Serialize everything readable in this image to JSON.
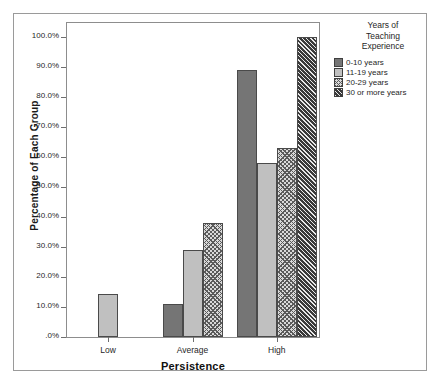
{
  "chart_data": {
    "type": "bar",
    "title": "",
    "xlabel": "Persistence",
    "ylabel": "Percentage of Each Group",
    "categories": [
      "Low",
      "Average",
      "High"
    ],
    "ylim": [
      0,
      100
    ],
    "ytick_labels": [
      "100.0%",
      "90.0%",
      "80.0%",
      "70.0%",
      "60.0%",
      "50.0%",
      "40.0%",
      "30.0%",
      "20.0%",
      "10.0%",
      ".0%"
    ],
    "ytick_values": [
      100,
      90,
      80,
      70,
      60,
      50,
      40,
      30,
      20,
      10,
      0
    ],
    "grid": false,
    "legend_position": "right",
    "legend_title": "Years of\nTeaching\nExperience",
    "series": [
      {
        "name": "0-10 years",
        "fill": "solid-dark",
        "color": "#757575",
        "values": [
          0,
          11,
          89
        ]
      },
      {
        "name": "11-19 years",
        "fill": "solid-light",
        "color": "#c0c0c0",
        "values": [
          14.3,
          29,
          58
        ]
      },
      {
        "name": "20-29 years",
        "fill": "hatch-light",
        "color": "#d9d9d9",
        "values": [
          0,
          38,
          63
        ]
      },
      {
        "name": "30 or more years",
        "fill": "hatch-dark",
        "color": "#3a3a3a",
        "values": [
          0,
          0,
          100
        ]
      }
    ]
  },
  "legend": {
    "title_lines": [
      "Years of",
      "Teaching",
      "Experience"
    ],
    "entries": [
      {
        "label": "0-10 years"
      },
      {
        "label": "11-19 years"
      },
      {
        "label": "20-29 years"
      },
      {
        "label": "30 or more years"
      }
    ]
  },
  "axes": {
    "y_title": "Percentage of Each Group",
    "x_title": "Persistence"
  }
}
